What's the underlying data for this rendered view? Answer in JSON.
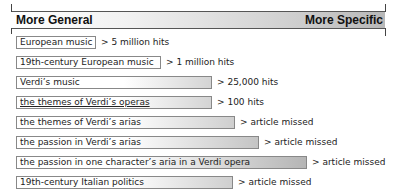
{
  "header": {
    "left_label": "More General",
    "right_label": "More Specific"
  },
  "rows": [
    {
      "query": "European music",
      "result": "> 5 million hits",
      "width": 80,
      "fill": 0
    },
    {
      "query": "19th-century European music",
      "result": "> 1 million hits",
      "width": 145,
      "fill": 0
    },
    {
      "query": "Verdi’s music",
      "result": "> 25,000 hits",
      "width": 196,
      "fill": 1
    },
    {
      "query": "the themes of Verdi’s operas",
      "result": "> 100 hits",
      "width": 196,
      "fill": 1,
      "underline": true
    },
    {
      "query": "the themes of Verdi’s arias",
      "result": "> article missed",
      "width": 219,
      "fill": 1
    },
    {
      "query": "the passion in Verdi’s arias",
      "result": "> article missed",
      "width": 243,
      "fill": 2
    },
    {
      "query": "the passion in one character’s aria in a Verdi opera",
      "result": "> article missed",
      "width": 291,
      "fill": 3
    },
    {
      "query": "19th-century Italian politics",
      "result": "> article missed",
      "width": 217,
      "fill": 1
    }
  ],
  "colors": {
    "band_end": "#b8b8b8",
    "box_border": "#888888",
    "text": "#222222"
  }
}
